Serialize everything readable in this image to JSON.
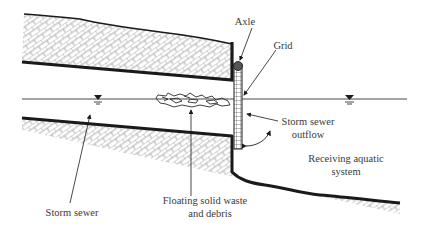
{
  "diagram": {
    "type": "cross-section schematic",
    "colors": {
      "line": "#1a1a1a",
      "hatch": "#9a9a9a",
      "text": "#3a3a3a",
      "axle": "#555555"
    },
    "labels": {
      "axle": "Axle",
      "grid": "Grid",
      "outflow_line1": "Storm sewer",
      "outflow_line2": "outflow",
      "receiving_line1": "Receiving aquatic",
      "receiving_line2": "system",
      "debris_line1": "Floating solid waste",
      "debris_line2": "and debris",
      "storm_sewer": "Storm sewer"
    },
    "symbols": {
      "water_level_left": "water-surface-symbol",
      "water_level_right": "water-surface-symbol"
    }
  }
}
